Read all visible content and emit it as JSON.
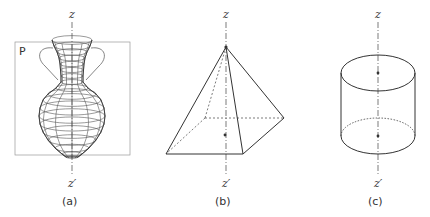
{
  "figures": [
    {
      "id": "a",
      "caption": "(a)",
      "axis_top": "z",
      "axis_bottom": "z′",
      "plane_label": "P",
      "subject": "vase wireframe with handles in plane"
    },
    {
      "id": "b",
      "caption": "(b)",
      "axis_top": "z",
      "axis_bottom": "z′",
      "subject": "square pyramid"
    },
    {
      "id": "c",
      "caption": "(c)",
      "axis_top": "z",
      "axis_bottom": "z′",
      "subject": "cylinder"
    }
  ],
  "colors": {
    "line": "#333333",
    "wire": "#555555",
    "plane": "#888888"
  }
}
